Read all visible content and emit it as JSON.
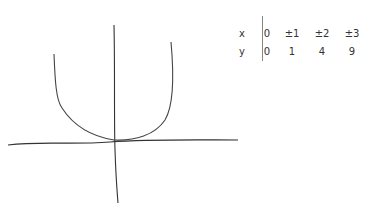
{
  "graph": {
    "function": "y = x^2",
    "axes": [
      "x-axis",
      "y-axis"
    ],
    "curve": "parabola opening upward with vertex at origin"
  },
  "table": {
    "rows": [
      {
        "label": "x",
        "values": [
          "0",
          "±1",
          "±2",
          "±3"
        ]
      },
      {
        "label": "y",
        "values": [
          "0",
          "1",
          "4",
          "9"
        ]
      }
    ]
  },
  "colors": {
    "ink": "#333333",
    "paper": "#ffffff"
  }
}
